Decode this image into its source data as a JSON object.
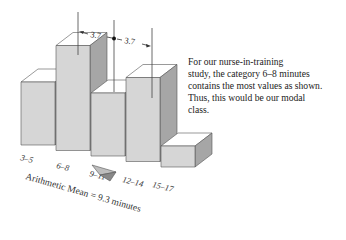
{
  "chart_data": {
    "type": "bar",
    "style": "3d-histogram",
    "title": "",
    "xlabel": "",
    "ylabel": "",
    "categories": [
      "3–5",
      "6–8",
      "9–11",
      "12–14",
      "15–17"
    ],
    "values": [
      3,
      5,
      3,
      4,
      1
    ],
    "grid": false,
    "legend": null,
    "annotations": {
      "mean_label": "Arithmetic Mean = 9.3 minutes",
      "mean_value": 9.3,
      "distance_left": "3.7",
      "distance_right": "3.7"
    },
    "colors": {
      "front": "#d6d6d6",
      "top": "#ffffff",
      "side": "#a6a6a6",
      "edge": "#555555"
    }
  },
  "caption": {
    "lines": [
      "For our nurse-in-training",
      "study, the category 6–8 minutes",
      "contains the most values as shown.",
      "Thus, this would be our modal",
      "class."
    ]
  }
}
